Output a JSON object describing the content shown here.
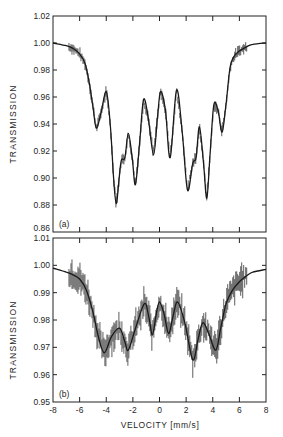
{
  "chart_data": [
    {
      "type": "scatter",
      "panel_label": "(a)",
      "title": "",
      "xlabel": "",
      "ylabel": "TRANSMISSION",
      "xlim": [
        -8,
        8
      ],
      "ylim": [
        0.86,
        1.02
      ],
      "xticks": [
        -8,
        -6,
        -4,
        -2,
        0,
        2,
        4,
        6,
        8
      ],
      "yticks": [
        "0.86",
        "0.88",
        "0.90",
        "0.92",
        "0.94",
        "0.96",
        "0.98",
        "1.00",
        "1.02"
      ],
      "grid": false,
      "series": [
        {
          "name": "fit",
          "x": [
            -8,
            -7,
            -6.5,
            -6,
            -5.6,
            -5.3,
            -5.0,
            -4.75,
            -4.4,
            -4.0,
            -3.7,
            -3.45,
            -3.25,
            -3.05,
            -2.87,
            -2.6,
            -2.34,
            -2.05,
            -1.81,
            -1.5,
            -1.2,
            -0.85,
            -0.45,
            -0.15,
            0.08,
            0.45,
            0.8,
            1.28,
            1.7,
            2.1,
            2.5,
            2.75,
            3.0,
            3.3,
            3.55,
            3.8,
            4.08,
            4.4,
            4.7,
            5.0,
            5.3,
            5.6,
            6.0,
            6.5,
            7.0,
            8.0
          ],
          "y": [
            1.0,
            0.998,
            0.996,
            0.992,
            0.985,
            0.972,
            0.953,
            0.937,
            0.948,
            0.964,
            0.94,
            0.9,
            0.881,
            0.898,
            0.913,
            0.915,
            0.933,
            0.915,
            0.895,
            0.925,
            0.958,
            0.945,
            0.917,
            0.945,
            0.964,
            0.95,
            0.915,
            0.965,
            0.935,
            0.891,
            0.911,
            0.915,
            0.938,
            0.912,
            0.885,
            0.918,
            0.954,
            0.95,
            0.934,
            0.955,
            0.982,
            0.99,
            0.994,
            0.997,
            0.999,
            1.0
          ]
        },
        {
          "name": "data points",
          "note": "measured points scattered closely along fit"
        }
      ]
    },
    {
      "type": "scatter",
      "panel_label": "(b)",
      "title": "",
      "xlabel": "VELOCITY [mm/s]",
      "ylabel": "TRANSMISSION",
      "xlim": [
        -8,
        8
      ],
      "ylim": [
        0.95,
        1.01
      ],
      "xticks": [
        -8,
        -6,
        -4,
        -2,
        0,
        2,
        4,
        6,
        8
      ],
      "yticks": [
        "0.95",
        "0.96",
        "0.97",
        "0.98",
        "0.99",
        "1.00",
        "1.01"
      ],
      "grid": false,
      "series": [
        {
          "name": "fit",
          "x": [
            -8,
            -7,
            -6.5,
            -6,
            -5.5,
            -5.0,
            -4.6,
            -4.15,
            -3.6,
            -3.0,
            -2.6,
            -2.34,
            -1.8,
            -1.13,
            -0.8,
            -0.53,
            -0.25,
            0.0,
            0.35,
            0.68,
            1.0,
            1.36,
            1.9,
            2.5,
            2.9,
            3.25,
            3.7,
            4.23,
            4.6,
            5.0,
            5.5,
            6.0,
            6.5,
            7.0,
            8.0
          ],
          "y": [
            0.999,
            0.9975,
            0.9965,
            0.995,
            0.991,
            0.983,
            0.974,
            0.968,
            0.974,
            0.977,
            0.972,
            0.969,
            0.977,
            0.986,
            0.981,
            0.9745,
            0.982,
            0.9866,
            0.982,
            0.975,
            0.981,
            0.9866,
            0.979,
            0.9654,
            0.973,
            0.979,
            0.975,
            0.969,
            0.977,
            0.986,
            0.991,
            0.994,
            0.996,
            0.9975,
            0.9985
          ]
        },
        {
          "name": "data points with error bars",
          "note": "noisy measured points with vertical error bars along fit"
        }
      ]
    }
  ],
  "labels": {
    "ylabel_top": "TRANSMISSION",
    "ylabel_bottom": "TRANSMISSION",
    "xlabel": "VELOCITY [mm/s]",
    "panel_a": "(a)",
    "panel_b": "(b)"
  }
}
